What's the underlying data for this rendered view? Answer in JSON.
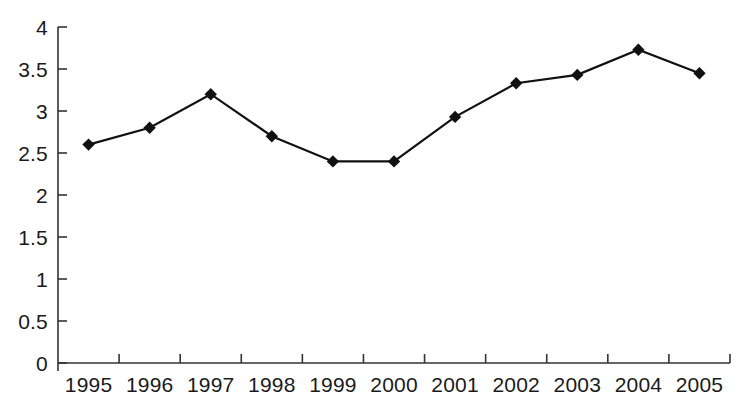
{
  "chart_data": {
    "type": "line",
    "title": "",
    "subtitle": "",
    "xlabel": "",
    "ylabel": "",
    "categories": [
      "1995",
      "1996",
      "1997",
      "1998",
      "1999",
      "2000",
      "2001",
      "2002",
      "2003",
      "2004",
      "2005"
    ],
    "values": [
      2.6,
      2.8,
      3.2,
      2.7,
      2.4,
      2.4,
      2.93,
      3.33,
      3.43,
      3.73,
      3.45
    ],
    "series": [
      {
        "name": "",
        "values": [
          2.6,
          2.8,
          3.2,
          2.7,
          2.4,
          2.4,
          2.93,
          3.33,
          3.43,
          3.73,
          3.45
        ]
      }
    ],
    "ylim": [
      0,
      4
    ],
    "y_ticks": [
      0,
      0.5,
      1,
      1.5,
      2,
      2.5,
      3,
      3.5,
      4
    ],
    "y_tick_labels": [
      "0",
      "0.5",
      "1",
      "1.5",
      "2",
      "2.5",
      "3",
      "3.5",
      "4"
    ],
    "grid": false,
    "legend": false,
    "legend_position": "none",
    "marker": "diamond",
    "line_color": "#111111",
    "marker_color": "#111111",
    "axis_color": "#333333",
    "background_color": "#ffffff"
  }
}
